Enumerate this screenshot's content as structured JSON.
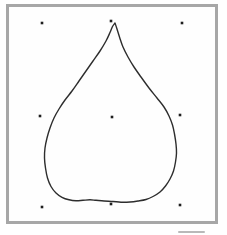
{
  "figure": {
    "canvas": {
      "width": 227,
      "height": 235,
      "background": "#ffffff"
    },
    "frame": {
      "x": 7.5,
      "y": 5.5,
      "width": 209,
      "height": 217,
      "border_color": "#a7a7a7",
      "border_width": 3,
      "fill": "#fefefe"
    },
    "curve": {
      "color": "#2d2d2d",
      "stroke_width": 1.4,
      "points": [
        [
          115,
          23
        ],
        [
          117,
          29
        ],
        [
          119.5,
          37
        ],
        [
          123,
          47
        ],
        [
          128,
          57
        ],
        [
          134,
          67
        ],
        [
          141,
          77
        ],
        [
          149,
          88
        ],
        [
          157,
          98
        ],
        [
          164,
          107
        ],
        [
          169,
          116
        ],
        [
          172.5,
          125
        ],
        [
          174.5,
          134
        ],
        [
          176,
          144
        ],
        [
          176.5,
          153
        ],
        [
          175.5,
          162
        ],
        [
          173.5,
          171
        ],
        [
          170,
          179
        ],
        [
          165.5,
          186
        ],
        [
          160,
          192
        ],
        [
          153,
          196.5
        ],
        [
          146,
          199.5
        ],
        [
          138,
          201
        ],
        [
          130,
          202
        ],
        [
          121,
          202.2
        ],
        [
          113,
          201.5
        ],
        [
          104,
          201
        ],
        [
          96,
          200.3
        ],
        [
          90,
          199.8
        ],
        [
          83,
          200.3
        ],
        [
          76,
          200.8
        ],
        [
          69,
          199.8
        ],
        [
          62,
          197.3
        ],
        [
          56,
          193
        ],
        [
          51,
          186.5
        ],
        [
          47.5,
          178
        ],
        [
          45.5,
          168
        ],
        [
          44.5,
          158
        ],
        [
          45,
          148
        ],
        [
          47,
          138
        ],
        [
          50,
          128
        ],
        [
          54,
          118
        ],
        [
          59,
          109
        ],
        [
          65,
          100
        ],
        [
          72,
          91
        ],
        [
          79,
          81
        ],
        [
          86,
          71
        ],
        [
          93,
          61
        ],
        [
          100,
          51
        ],
        [
          106,
          41
        ],
        [
          110,
          32.5
        ],
        [
          112.5,
          26.5
        ],
        [
          115,
          23
        ]
      ]
    },
    "control_points": {
      "color": "#1f1f1f",
      "size": 2.6,
      "positions": [
        [
          42,
          23
        ],
        [
          111,
          21
        ],
        [
          182,
          23
        ],
        [
          40,
          116
        ],
        [
          112,
          117
        ],
        [
          180,
          115
        ],
        [
          42,
          207
        ],
        [
          111,
          204
        ],
        [
          180,
          205
        ]
      ]
    },
    "scan_artifact": {
      "x": 178,
      "y": 231,
      "width": 27,
      "height": 2,
      "color": "#b9b9b9"
    }
  }
}
